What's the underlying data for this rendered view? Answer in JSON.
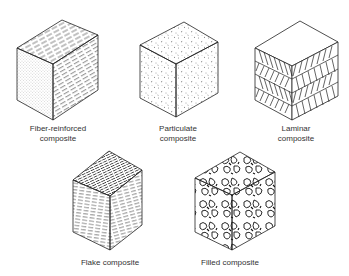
{
  "diagram": {
    "items": [
      {
        "id": "fiber",
        "label_line1": "Fiber-reinforced",
        "label_line2": "composite",
        "pattern": "fibers"
      },
      {
        "id": "particulate",
        "label_line1": "Particulate",
        "label_line2": "composite",
        "pattern": "particles"
      },
      {
        "id": "laminar",
        "label_line1": "Laminar",
        "label_line2": "composite",
        "pattern": "laminae"
      },
      {
        "id": "flake",
        "label_line1": "Flake composite",
        "label_line2": "",
        "pattern": "flakes"
      },
      {
        "id": "filled",
        "label_line1": "Filled composite",
        "label_line2": "",
        "pattern": "filled"
      }
    ],
    "colors": {
      "line": "#222222",
      "text": "#333333",
      "background": "#ffffff"
    }
  }
}
